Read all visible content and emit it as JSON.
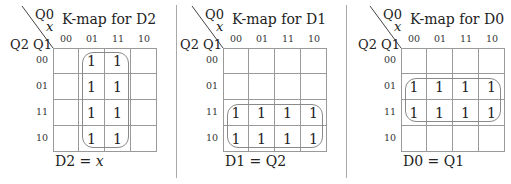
{
  "col_var": "Q0",
  "input_var": "x",
  "row_vars": "Q2 Q1",
  "col_headers": [
    "00",
    "01",
    "11",
    "10"
  ],
  "row_headers": [
    "00",
    "01",
    "11",
    "10"
  ],
  "kmaps": [
    {
      "title": "K-map for D2",
      "cells": [
        [
          "",
          "1",
          "1",
          ""
        ],
        [
          "",
          "1",
          "1",
          ""
        ],
        [
          "",
          "1",
          "1",
          ""
        ],
        [
          "",
          "1",
          "1",
          ""
        ]
      ],
      "group": {
        "rows": [
          0,
          3
        ],
        "cols": [
          1,
          2
        ]
      },
      "equation_lhs": "D2 = ",
      "equation_rhs": "x"
    },
    {
      "title": "K-map for D1",
      "cells": [
        [
          "",
          "",
          "",
          ""
        ],
        [
          "",
          "",
          "",
          ""
        ],
        [
          "1",
          "1",
          "1",
          "1"
        ],
        [
          "1",
          "1",
          "1",
          "1"
        ]
      ],
      "group": {
        "rows": [
          2,
          3
        ],
        "cols": [
          0,
          3
        ]
      },
      "equation_lhs": "D1 = ",
      "equation_rhs": "Q2"
    },
    {
      "title": "K-map for D0",
      "cells": [
        [
          "",
          "",
          "",
          ""
        ],
        [
          "1",
          "1",
          "1",
          "1"
        ],
        [
          "1",
          "1",
          "1",
          "1"
        ],
        [
          "",
          "",
          "",
          ""
        ]
      ],
      "group": {
        "rows": [
          1,
          2
        ],
        "cols": [
          0,
          3
        ]
      },
      "equation_lhs": "D0 = ",
      "equation_rhs": "Q1"
    }
  ],
  "colors": {
    "grid": "#9a9a9a",
    "group_outline": "#8a8a8a",
    "divider": "#aaaaaa",
    "text": "#222222"
  }
}
